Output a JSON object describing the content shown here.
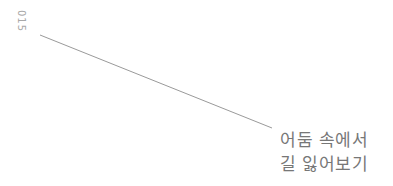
{
  "page": {
    "number": "015",
    "title_lines": [
      "어둠 속에서",
      "길 잃어보기"
    ]
  },
  "colors": {
    "text": "#777777",
    "page_number": "#a8a8a8",
    "line": "#9a9a9a",
    "background": "#ffffff"
  }
}
